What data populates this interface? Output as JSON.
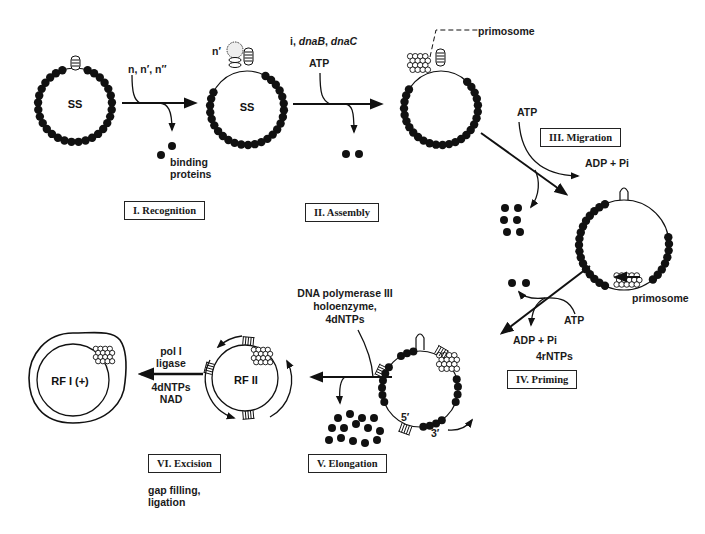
{
  "diagram": {
    "topic": "Primosome-mediated conversion of single-stranded phage DNA to replicative form",
    "stages": [
      {
        "id": "I",
        "label": "I. Recognition"
      },
      {
        "id": "II",
        "label": "II. Assembly"
      },
      {
        "id": "III",
        "label": "III. Migration"
      },
      {
        "id": "IV",
        "label": "IV. Priming"
      },
      {
        "id": "V",
        "label": "V. Elongation"
      },
      {
        "id": "VI",
        "label": "VI. Excision"
      }
    ],
    "circles": {
      "c1": "SS",
      "c2": "SS",
      "rf2": "RF II",
      "rf1": "RF I  (+)"
    },
    "step1": {
      "input": "n, n′, n″",
      "output_line1": "binding",
      "output_line2": "proteins"
    },
    "step2": {
      "blob_label": "n′",
      "input_prefix": "i, ",
      "input_italic1": "dnaB",
      "input_sep": ", ",
      "input_italic2": "dnaC",
      "atp": "ATP"
    },
    "step3": {
      "primosome_label": "primosome",
      "atp": "ATP",
      "adp": "ADP + Pi"
    },
    "step4": {
      "primosome_label": "primosome",
      "atp": "ATP",
      "adp": "ADP + Pi",
      "rntps": "4rNTPs"
    },
    "step5": {
      "line1": "DNA polymerase III",
      "line2": "holoenzyme,",
      "line3": "4dNTPs",
      "five_prime": "5′",
      "three_prime": "3′"
    },
    "step6": {
      "line1": "pol I",
      "line2": "ligase",
      "line3": "4dNTPs",
      "line4": "NAD",
      "note_line1": "gap filling,",
      "note_line2": "ligation"
    },
    "colors": {
      "ink": "#111111",
      "background": "#ffffff"
    }
  }
}
